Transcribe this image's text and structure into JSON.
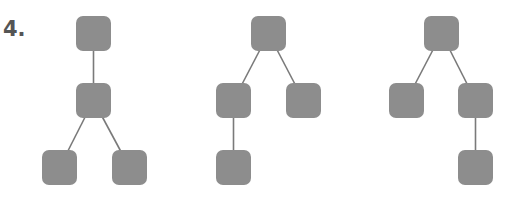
{
  "label": "4.",
  "colors": {
    "node": "#8d8d8d",
    "edge": "#7a7a7a",
    "background": "#ffffff",
    "label": "#555555"
  },
  "node_size": 35,
  "node_radius": 7,
  "trees": [
    {
      "name": "tree-1",
      "nodes": [
        {
          "id": "a",
          "x": 76,
          "y": 16
        },
        {
          "id": "b",
          "x": 76,
          "y": 83
        },
        {
          "id": "c",
          "x": 42,
          "y": 150
        },
        {
          "id": "d",
          "x": 112,
          "y": 150
        }
      ],
      "edges": [
        [
          "a",
          "b"
        ],
        [
          "b",
          "c"
        ],
        [
          "b",
          "d"
        ]
      ]
    },
    {
      "name": "tree-2",
      "nodes": [
        {
          "id": "a",
          "x": 251,
          "y": 16
        },
        {
          "id": "b",
          "x": 216,
          "y": 83
        },
        {
          "id": "c",
          "x": 286,
          "y": 83
        },
        {
          "id": "d",
          "x": 216,
          "y": 150
        }
      ],
      "edges": [
        [
          "a",
          "b"
        ],
        [
          "a",
          "c"
        ],
        [
          "b",
          "d"
        ]
      ]
    },
    {
      "name": "tree-3",
      "nodes": [
        {
          "id": "a",
          "x": 424,
          "y": 16
        },
        {
          "id": "b",
          "x": 389,
          "y": 83
        },
        {
          "id": "c",
          "x": 458,
          "y": 83
        },
        {
          "id": "d",
          "x": 458,
          "y": 150
        }
      ],
      "edges": [
        [
          "a",
          "b"
        ],
        [
          "a",
          "c"
        ],
        [
          "c",
          "d"
        ]
      ]
    }
  ]
}
